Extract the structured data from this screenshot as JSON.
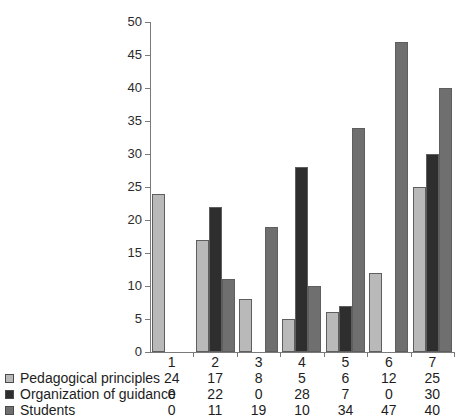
{
  "chart_data": {
    "type": "bar",
    "title": "",
    "xlabel": "",
    "ylabel": "",
    "categories": [
      "1",
      "2",
      "3",
      "4",
      "5",
      "6",
      "7"
    ],
    "ylim": [
      0,
      50
    ],
    "yticks": [
      0,
      5,
      10,
      15,
      20,
      25,
      30,
      35,
      40,
      45,
      50
    ],
    "grid": false,
    "legend_position": "bottom-left",
    "series": [
      {
        "name": "Pedagogical principles",
        "color": "#b9b9b9",
        "values": [
          24,
          17,
          8,
          5,
          6,
          12,
          25
        ]
      },
      {
        "name": "Organization of guidance",
        "color": "#2e2e2e",
        "values": [
          0,
          22,
          0,
          28,
          7,
          0,
          30
        ]
      },
      {
        "name": "Students",
        "color": "#6f6f6f",
        "values": [
          0,
          11,
          19,
          10,
          34,
          47,
          40
        ]
      }
    ]
  },
  "axis": {
    "tick_labels": [
      "0",
      "5",
      "10",
      "15",
      "20",
      "25",
      "30",
      "35",
      "40",
      "45",
      "50"
    ]
  },
  "table": {
    "header": [
      "1",
      "2",
      "3",
      "4",
      "5",
      "6",
      "7"
    ],
    "rows": [
      {
        "label": "Pedagogical principles",
        "swatch_color": "#b9b9b9",
        "values": [
          "24",
          "17",
          "8",
          "5",
          "6",
          "12",
          "25"
        ]
      },
      {
        "label": "Organization of guidance",
        "swatch_color": "#2e2e2e",
        "values": [
          "0",
          "22",
          "0",
          "28",
          "7",
          "0",
          "30"
        ]
      },
      {
        "label": "Students",
        "swatch_color": "#6f6f6f",
        "values": [
          "0",
          "11",
          "19",
          "10",
          "34",
          "47",
          "40"
        ]
      }
    ]
  }
}
